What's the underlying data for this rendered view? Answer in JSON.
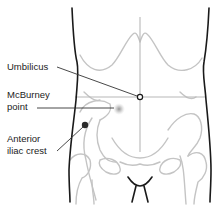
{
  "diagram": {
    "labels": [
      {
        "id": "umbilicus",
        "lines": [
          "Umbilicus"
        ]
      },
      {
        "id": "mcburney",
        "lines": [
          "McBurney",
          "point"
        ]
      },
      {
        "id": "iliac",
        "lines": [
          "Anterior",
          "iliac crest"
        ]
      }
    ],
    "colors": {
      "outline": "#1a1a1a",
      "bone": "#c4c4c4",
      "leader": "#333333",
      "mcburney_glow": "#9a9a9a",
      "iliac_dot": "#2a2a2a"
    }
  }
}
